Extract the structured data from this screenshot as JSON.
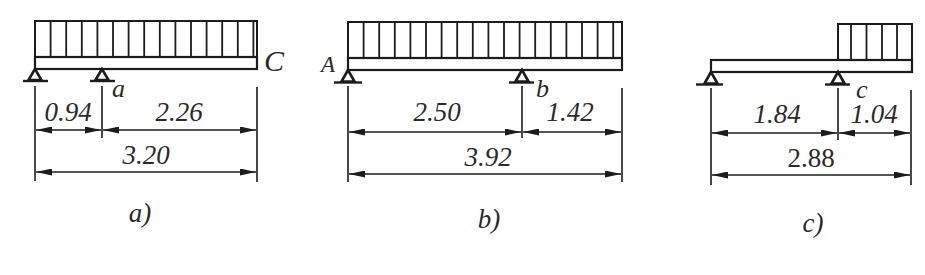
{
  "figure": {
    "panels": [
      {
        "caption": "a)",
        "labels": {
          "end": "C",
          "support": "a"
        },
        "dimensions": {
          "left_span": "0.94",
          "right_span": "2.26",
          "total": "3.20"
        }
      },
      {
        "caption": "b)",
        "labels": {
          "start": "A",
          "support": "b"
        },
        "dimensions": {
          "left_span": "2.50",
          "right_span": "1.42",
          "total": "3.92"
        }
      },
      {
        "caption": "c)",
        "labels": {
          "support": "c"
        },
        "dimensions": {
          "left_span": "1.84",
          "right_span": "1.04",
          "total": "2.88"
        }
      }
    ]
  }
}
